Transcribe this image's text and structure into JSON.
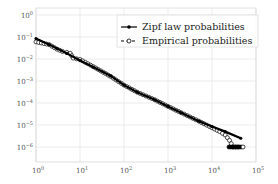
{
  "chart_data": {
    "type": "line",
    "title": "",
    "xlabel": "",
    "ylabel": "",
    "xscale": "log",
    "yscale": "log",
    "xlim": [
      1,
      100000
    ],
    "ylim": [
      3e-07,
      1
    ],
    "grid": true,
    "legend_position": "upper right",
    "x_ticks": [
      "10^0",
      "10^1",
      "10^2",
      "10^3",
      "10^4",
      "10^5"
    ],
    "y_ticks": [
      "10^0",
      "10^-1",
      "10^-2",
      "10^-3",
      "10^-4",
      "10^-5",
      "10^-6"
    ],
    "series": [
      {
        "name": "Zipf law probabilities",
        "style": "solid line, filled circle markers",
        "color": "#000000",
        "x": [
          1,
          2,
          3,
          5,
          10,
          20,
          50,
          100,
          200,
          500,
          1000,
          2000,
          5000,
          10000,
          20000,
          45000
        ],
        "y": [
          0.085,
          0.045,
          0.03,
          0.018,
          0.0085,
          0.0043,
          0.0017,
          0.00065,
          0.00031,
          0.00014,
          7e-05,
          3.6e-05,
          1.5e-05,
          8.5e-06,
          5e-06,
          2.5e-06
        ]
      },
      {
        "name": "Empirical probabilities",
        "style": "dashed line, open circle markers",
        "color": "#000000",
        "x": [
          1,
          2,
          3,
          4,
          5,
          6,
          7,
          10,
          20,
          50,
          100,
          200,
          500,
          1000,
          2000,
          5000,
          10000,
          15000,
          20000,
          25000,
          30000,
          45000
        ],
        "y": [
          0.06,
          0.045,
          0.028,
          0.022,
          0.02,
          0.018,
          0.011,
          0.0095,
          0.0045,
          0.0016,
          0.00065,
          0.00031,
          0.00014,
          7e-05,
          3.6e-05,
          1.5e-05,
          7.5e-06,
          5e-06,
          3.5e-06,
          2e-06,
          1e-06,
          1e-06
        ]
      }
    ]
  },
  "legend": {
    "zipf_label": "Zipf law probabilities",
    "empirical_label": "Empirical probabilities"
  },
  "axes": {
    "x_tick_labels": [
      {
        "base": "10",
        "exp": "0"
      },
      {
        "base": "10",
        "exp": "1"
      },
      {
        "base": "10",
        "exp": "2"
      },
      {
        "base": "10",
        "exp": "3"
      },
      {
        "base": "10",
        "exp": "4"
      },
      {
        "base": "10",
        "exp": "5"
      }
    ],
    "y_tick_labels": [
      {
        "base": "10",
        "exp": "0"
      },
      {
        "base": "10",
        "exp": "−1"
      },
      {
        "base": "10",
        "exp": "−2"
      },
      {
        "base": "10",
        "exp": "−3"
      },
      {
        "base": "10",
        "exp": "−4"
      },
      {
        "base": "10",
        "exp": "−5"
      },
      {
        "base": "10",
        "exp": "−6"
      }
    ]
  }
}
